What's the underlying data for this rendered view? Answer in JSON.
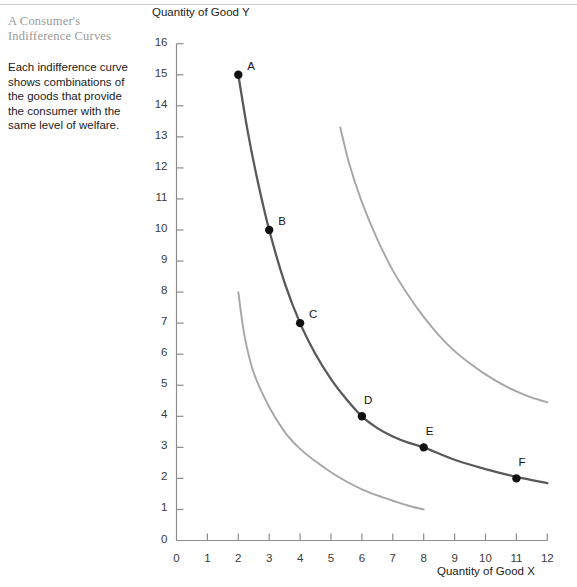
{
  "figure": {
    "caption": "Each indifference curve shows combinations of the goods that provide the consumer with the same level of welfare."
  },
  "colors": {
    "main_curve": "#595959",
    "other_curves": "#a6a6a6",
    "axis": "#8c8c8c",
    "point": "#111111",
    "title": "#9a9a9a",
    "rule": "#c9c9c9"
  },
  "chart_data": {
    "type": "line",
    "xlabel": "Quantity of Good X",
    "ylabel": "Quantity of Good Y",
    "xlim": [
      0,
      12
    ],
    "ylim": [
      0,
      16
    ],
    "xticks": [
      0,
      1,
      2,
      3,
      4,
      5,
      6,
      7,
      8,
      9,
      10,
      11,
      12
    ],
    "yticks": [
      0,
      1,
      2,
      3,
      4,
      5,
      6,
      7,
      8,
      9,
      10,
      11,
      12,
      13,
      14,
      15,
      16
    ],
    "grid": false,
    "legend": null,
    "series": [
      {
        "name": "lower-indifference-curve",
        "style": "light",
        "color": "#a6a6a6",
        "points": [
          {
            "x": 2.0,
            "y": 8.0
          },
          {
            "x": 2.2,
            "y": 6.6
          },
          {
            "x": 2.5,
            "y": 5.4
          },
          {
            "x": 3.0,
            "y": 4.3
          },
          {
            "x": 3.5,
            "y": 3.5
          },
          {
            "x": 4.0,
            "y": 2.95
          },
          {
            "x": 4.5,
            "y": 2.55
          },
          {
            "x": 5.0,
            "y": 2.2
          },
          {
            "x": 5.5,
            "y": 1.9
          },
          {
            "x": 6.0,
            "y": 1.65
          },
          {
            "x": 6.5,
            "y": 1.45
          },
          {
            "x": 7.0,
            "y": 1.28
          },
          {
            "x": 7.5,
            "y": 1.12
          },
          {
            "x": 8.0,
            "y": 1.0
          }
        ]
      },
      {
        "name": "main-indifference-curve",
        "style": "dark",
        "color": "#595959",
        "points": [
          {
            "x": 2.0,
            "y": 15.0
          },
          {
            "x": 2.3,
            "y": 13.2
          },
          {
            "x": 2.6,
            "y": 11.7
          },
          {
            "x": 3.0,
            "y": 10.0
          },
          {
            "x": 3.5,
            "y": 8.3
          },
          {
            "x": 4.0,
            "y": 7.0
          },
          {
            "x": 4.5,
            "y": 6.0
          },
          {
            "x": 5.0,
            "y": 5.2
          },
          {
            "x": 5.5,
            "y": 4.55
          },
          {
            "x": 6.0,
            "y": 4.0
          },
          {
            "x": 6.5,
            "y": 3.62
          },
          {
            "x": 7.0,
            "y": 3.35
          },
          {
            "x": 7.5,
            "y": 3.15
          },
          {
            "x": 8.0,
            "y": 3.0
          },
          {
            "x": 9.0,
            "y": 2.6
          },
          {
            "x": 10.0,
            "y": 2.3
          },
          {
            "x": 11.0,
            "y": 2.05
          },
          {
            "x": 12.0,
            "y": 1.85
          }
        ]
      },
      {
        "name": "upper-indifference-curve",
        "style": "light",
        "color": "#a6a6a6",
        "points": [
          {
            "x": 5.3,
            "y": 13.3
          },
          {
            "x": 5.6,
            "y": 12.1
          },
          {
            "x": 6.0,
            "y": 10.9
          },
          {
            "x": 6.5,
            "y": 9.7
          },
          {
            "x": 7.0,
            "y": 8.7
          },
          {
            "x": 7.5,
            "y": 7.9
          },
          {
            "x": 8.0,
            "y": 7.2
          },
          {
            "x": 8.5,
            "y": 6.6
          },
          {
            "x": 9.0,
            "y": 6.1
          },
          {
            "x": 9.5,
            "y": 5.7
          },
          {
            "x": 10.0,
            "y": 5.35
          },
          {
            "x": 10.5,
            "y": 5.05
          },
          {
            "x": 11.0,
            "y": 4.8
          },
          {
            "x": 11.5,
            "y": 4.6
          },
          {
            "x": 12.0,
            "y": 4.45
          }
        ]
      }
    ],
    "annotations": [
      {
        "label": "A",
        "x": 2,
        "y": 15
      },
      {
        "label": "B",
        "x": 3,
        "y": 10
      },
      {
        "label": "C",
        "x": 4,
        "y": 7
      },
      {
        "label": "D",
        "x": 6,
        "y": 4
      },
      {
        "label": "E",
        "x": 8,
        "y": 3
      },
      {
        "label": "F",
        "x": 11,
        "y": 2
      }
    ]
  }
}
